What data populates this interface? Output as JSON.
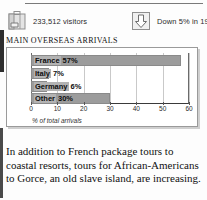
{
  "header": {
    "stats": [
      {
        "icon": "suitcase-icon",
        "text": "233,512 visitors"
      },
      {
        "icon": "down-arrow-icon",
        "text": "Down 5% in 1991"
      }
    ]
  },
  "section": {
    "title": "MAIN OVERSEAS ARRIVALS"
  },
  "chart_data": {
    "type": "bar",
    "orientation": "horizontal",
    "title": "MAIN OVERSEAS ARRIVALS",
    "categories": [
      "France",
      "Italy",
      "Germany",
      "Other"
    ],
    "values": [
      57,
      7,
      6,
      30
    ],
    "labels": [
      "France 57%",
      "Italy 7%",
      "Germany 6%",
      "Other 30%"
    ],
    "value_labels": [
      "57%",
      "7%",
      "6%",
      "30%"
    ],
    "xlabel": "% of total arrivals",
    "ylabel": "",
    "xlim": [
      0,
      60
    ],
    "xticks": [
      0,
      10,
      20,
      30,
      40,
      50,
      60
    ],
    "xtick_labels": [
      "0",
      "10",
      "20",
      "30",
      "40",
      "50",
      "60"
    ],
    "grid": true,
    "legend": false,
    "bar_color": "#9c9c9c",
    "label_bg_color": "#b3b3b3"
  },
  "article": {
    "paragraph": "In addition to French package tours to coastal resorts, tours for African-Americans to Gorce, an old slave island, are increasing."
  }
}
